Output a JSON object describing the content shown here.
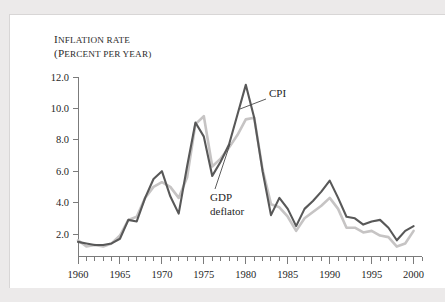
{
  "figure": {
    "panel_background": "#ffffff",
    "outer_background": "#eceaea"
  },
  "chart_data": {
    "type": "line",
    "title": "",
    "axis_title_line1": "Inflation rate",
    "axis_title_line2": "(Percent per year)",
    "xlabel": "",
    "ylabel": "Inflation rate (Percent per year)",
    "xlim": [
      1960,
      2001
    ],
    "ylim": [
      0,
      12.6
    ],
    "grid": false,
    "legend_position": "inline-annotations",
    "ytick_labels": [
      "12.0",
      "10.0",
      "8.0",
      "6.0",
      "4.0",
      "2.0"
    ],
    "yticks": [
      12.0,
      10.0,
      8.0,
      6.0,
      4.0,
      2.0
    ],
    "xtick_labels": [
      "1960",
      "1965",
      "1970",
      "1975",
      "1980",
      "1985",
      "1990",
      "1995",
      "2000"
    ],
    "xticks": [
      1960,
      1965,
      1970,
      1975,
      1980,
      1985,
      1990,
      1995,
      2000
    ],
    "x_minor_step": 1,
    "x": [
      1960,
      1961,
      1962,
      1963,
      1964,
      1965,
      1966,
      1967,
      1968,
      1969,
      1970,
      1971,
      1972,
      1973,
      1974,
      1975,
      1976,
      1977,
      1978,
      1979,
      1980,
      1981,
      1982,
      1983,
      1984,
      1985,
      1986,
      1987,
      1988,
      1989,
      1990,
      1991,
      1992,
      1993,
      1994,
      1995,
      1996,
      1997,
      1998,
      1999,
      2000
    ],
    "series": [
      {
        "name": "CPI",
        "color": "#585858",
        "width": 2.1,
        "values": [
          1.5,
          1.4,
          1.3,
          1.3,
          1.4,
          1.7,
          2.9,
          2.8,
          4.3,
          5.5,
          6.0,
          4.4,
          3.3,
          6.3,
          9.1,
          8.2,
          5.7,
          6.6,
          7.7,
          9.6,
          11.5,
          9.4,
          6.0,
          3.2,
          4.3,
          3.6,
          2.5,
          3.6,
          4.1,
          4.7,
          5.4,
          4.3,
          3.1,
          3.0,
          2.6,
          2.8,
          2.9,
          2.4,
          1.6,
          2.2,
          2.5
        ]
      },
      {
        "name": "GDP deflator",
        "color": "#c6c4c4",
        "width": 2.6,
        "values": [
          1.6,
          1.2,
          1.3,
          1.2,
          1.4,
          1.9,
          2.9,
          3.1,
          4.3,
          5.0,
          5.3,
          5.0,
          4.3,
          5.6,
          9.0,
          9.5,
          6.3,
          6.8,
          7.5,
          8.3,
          9.3,
          9.4,
          6.1,
          3.9,
          3.7,
          3.1,
          2.2,
          3.0,
          3.4,
          3.8,
          4.3,
          3.6,
          2.4,
          2.4,
          2.1,
          2.2,
          1.9,
          1.8,
          1.2,
          1.4,
          2.2
        ]
      }
    ],
    "annotations": [
      {
        "name": "cpi-label",
        "text": "CPI",
        "lines": [
          "CPI"
        ],
        "text_x": 259,
        "text_y": 82,
        "leader_from_x": 256,
        "leader_from_y": 84,
        "leader_to_x": 230,
        "leader_to_y": 94
      },
      {
        "name": "gdp-deflator-label",
        "text": "GDP deflator",
        "lines": [
          "GDP",
          "deflator"
        ],
        "text_x": 200,
        "text_y": 186,
        "leader_from_x": 205,
        "leader_from_y": 174,
        "leader_to_x": 220,
        "leader_to_y": 129
      }
    ]
  }
}
